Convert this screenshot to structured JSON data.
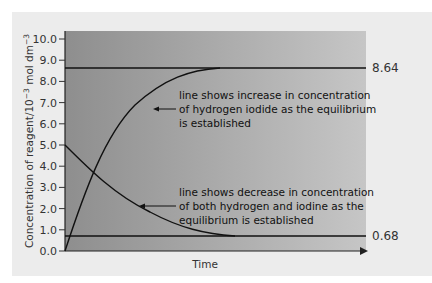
{
  "chart_data": {
    "type": "line",
    "title": "",
    "xlabel": "Time",
    "ylabel": "Concentration of reagent/10^-3 mol dm^-3",
    "ylabel_parts": {
      "main": "Concentration of reagent/10",
      "exp1": "−3",
      "unit": " mol dm",
      "exp2": "−3"
    },
    "ylim": [
      0,
      10
    ],
    "yticks": [
      "0.0",
      "1.0",
      "2.0",
      "3.0",
      "4.0",
      "5.0",
      "6.0",
      "7.0",
      "8.0",
      "9.0",
      "10.0"
    ],
    "grid": false,
    "series": [
      {
        "name": "hydrogen iodide",
        "description": "increases from 0.0 to equilibrium 8.64",
        "points": [
          [
            0,
            0.0
          ],
          [
            0.1,
            3.8
          ],
          [
            0.2,
            6.2
          ],
          [
            0.3,
            7.6
          ],
          [
            0.4,
            8.3
          ],
          [
            0.5,
            8.6
          ],
          [
            1.0,
            8.64
          ]
        ]
      },
      {
        "name": "hydrogen and iodine",
        "description": "decreases from 5.0 to equilibrium 0.68",
        "points": [
          [
            0,
            5.0
          ],
          [
            0.1,
            3.3
          ],
          [
            0.2,
            2.2
          ],
          [
            0.3,
            1.5
          ],
          [
            0.4,
            1.0
          ],
          [
            0.55,
            0.7
          ],
          [
            1.0,
            0.68
          ]
        ]
      }
    ],
    "equilibrium_lines": [
      {
        "value": 8.64,
        "label": "8.64"
      },
      {
        "value": 0.68,
        "label": "0.68"
      }
    ],
    "annotations": [
      {
        "lines": [
          "line shows increase in concentration",
          "of hydrogen iodide as the equilibrium",
          "is established"
        ]
      },
      {
        "lines": [
          "line shows decrease in concentration",
          "of both hydrogen and iodine as the",
          "equilibrium is established"
        ]
      }
    ]
  }
}
